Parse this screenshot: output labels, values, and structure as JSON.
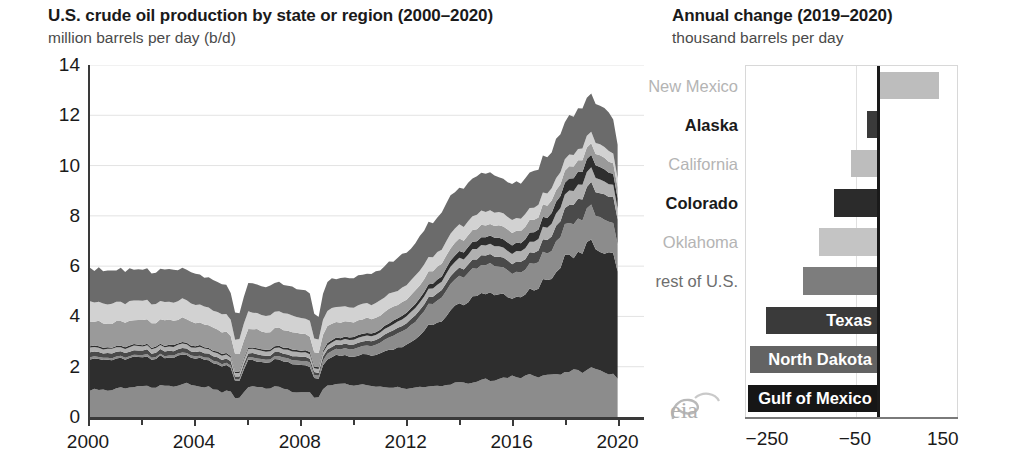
{
  "left": {
    "title": "U.S. crude oil production by state or region (2000–2020)",
    "subtitle": "million barrels per day (b/d)"
  },
  "right": {
    "title": "Annual change (2019–2020)",
    "subtitle": "thousand barrels per day"
  },
  "logo": {
    "name": "eia-logo",
    "text": "eia"
  },
  "chart_data": [
    {
      "type": "area",
      "stacked": true,
      "title": "U.S. crude oil production by state or region (2000–2020)",
      "xlabel": "",
      "ylabel": "million barrels per day (b/d)",
      "xlim": [
        2000,
        2021
      ],
      "ylim": [
        0,
        14
      ],
      "ytick_labels": [
        "0",
        "2",
        "4",
        "6",
        "8",
        "10",
        "12",
        "14"
      ],
      "ytick_values": [
        0,
        2,
        4,
        6,
        8,
        10,
        12,
        14
      ],
      "xtick_labels": [
        "2000",
        "2004",
        "2008",
        "2012",
        "2016",
        "2020"
      ],
      "xtick_values": [
        2000,
        2004,
        2008,
        2012,
        2016,
        2020
      ],
      "grid": "horizontal",
      "legend": "none",
      "x": [
        2000,
        2001,
        2002,
        2003,
        2004,
        2005,
        2006,
        2007,
        2008,
        2009,
        2010,
        2011,
        2012,
        2013,
        2014,
        2015,
        2016,
        2017,
        2018,
        2019,
        2020
      ],
      "series": [
        {
          "name": "Gulf of Mexico",
          "color": "#8c8c8c",
          "values": [
            1.05,
            1.1,
            1.2,
            1.25,
            1.3,
            1.0,
            1.15,
            1.2,
            0.95,
            1.3,
            1.3,
            1.2,
            1.15,
            1.2,
            1.35,
            1.5,
            1.6,
            1.65,
            1.75,
            1.9,
            1.65
          ]
        },
        {
          "name": "Texas",
          "color": "#2e2e2e",
          "values": [
            1.25,
            1.2,
            1.15,
            1.15,
            1.1,
            1.05,
            1.05,
            1.05,
            1.1,
            1.1,
            1.15,
            1.3,
            1.75,
            2.45,
            3.15,
            3.45,
            3.2,
            3.5,
            4.4,
            5.05,
            4.65
          ]
        },
        {
          "name": "North Dakota",
          "color": "#8c8c8c",
          "values": [
            0.09,
            0.08,
            0.08,
            0.08,
            0.09,
            0.1,
            0.11,
            0.12,
            0.17,
            0.22,
            0.3,
            0.42,
            0.65,
            0.85,
            1.1,
            1.15,
            1.0,
            1.05,
            1.25,
            1.42,
            1.15
          ]
        },
        {
          "name": "New Mexico",
          "color": "#4a4a4a",
          "values": [
            0.19,
            0.18,
            0.18,
            0.18,
            0.17,
            0.17,
            0.16,
            0.16,
            0.16,
            0.17,
            0.18,
            0.2,
            0.23,
            0.28,
            0.33,
            0.38,
            0.4,
            0.47,
            0.67,
            0.93,
            1.07
          ]
        },
        {
          "name": "Oklahoma",
          "color": "#b0b0b0",
          "values": [
            0.18,
            0.17,
            0.17,
            0.17,
            0.17,
            0.17,
            0.17,
            0.17,
            0.18,
            0.18,
            0.19,
            0.21,
            0.27,
            0.33,
            0.38,
            0.42,
            0.4,
            0.46,
            0.54,
            0.58,
            0.46
          ]
        },
        {
          "name": "Colorado",
          "color": "#2e2e2e",
          "values": [
            0.06,
            0.06,
            0.06,
            0.06,
            0.06,
            0.06,
            0.06,
            0.07,
            0.08,
            0.09,
            0.1,
            0.12,
            0.15,
            0.19,
            0.27,
            0.33,
            0.33,
            0.37,
            0.48,
            0.52,
            0.42
          ]
        },
        {
          "name": "Alaska",
          "color": "#9a9a9a",
          "values": [
            0.97,
            0.96,
            0.98,
            0.97,
            0.91,
            0.86,
            0.74,
            0.72,
            0.68,
            0.65,
            0.6,
            0.56,
            0.53,
            0.51,
            0.48,
            0.48,
            0.49,
            0.48,
            0.47,
            0.46,
            0.44
          ]
        },
        {
          "name": "California",
          "color": "#d2d2d2",
          "values": [
            0.79,
            0.77,
            0.76,
            0.74,
            0.73,
            0.7,
            0.69,
            0.66,
            0.64,
            0.62,
            0.6,
            0.59,
            0.58,
            0.57,
            0.56,
            0.54,
            0.51,
            0.48,
            0.47,
            0.45,
            0.39
          ]
        },
        {
          "name": "rest of U.S.",
          "color": "#6b6b6b",
          "values": [
            1.33,
            1.3,
            1.28,
            1.26,
            1.23,
            1.16,
            1.16,
            1.14,
            1.1,
            1.14,
            1.17,
            1.22,
            1.3,
            1.4,
            1.52,
            1.53,
            1.4,
            1.42,
            1.53,
            1.6,
            1.42
          ]
        }
      ]
    },
    {
      "type": "bar",
      "orientation": "horizontal",
      "title": "Annual change (2019–2020)",
      "xlabel": "thousand barrels per day",
      "ylabel": "",
      "xlim": [
        -300,
        180
      ],
      "xtick_labels": [
        "−250",
        "−50",
        "150"
      ],
      "xtick_values": [
        -250,
        -50,
        150
      ],
      "grid": "vertical",
      "categories": [
        "New Mexico",
        "Alaska",
        "California",
        "Colorado",
        "Oklahoma",
        "rest of U.S.",
        "Texas",
        "North Dakota",
        "Gulf of Mexico"
      ],
      "values": [
        140,
        -25,
        -62,
        -100,
        -135,
        -170,
        -255,
        -290,
        -295
      ],
      "bars": [
        {
          "label": "New Mexico",
          "value": 140,
          "color": "#bdbdbd",
          "label_style": "light",
          "label_inside": false
        },
        {
          "label": "Alaska",
          "value": -25,
          "color": "#3a3a3a",
          "label_style": "bold",
          "label_inside": false
        },
        {
          "label": "California",
          "value": -62,
          "color": "#bdbdbd",
          "label_style": "light",
          "label_inside": false
        },
        {
          "label": "Colorado",
          "value": -100,
          "color": "#2b2b2b",
          "label_style": "bold",
          "label_inside": false
        },
        {
          "label": "Oklahoma",
          "value": -135,
          "color": "#c4c4c4",
          "label_style": "light",
          "label_inside": false
        },
        {
          "label": "rest of U.S.",
          "value": -170,
          "color": "#7d7d7d",
          "label_style": "mid",
          "label_inside": false
        },
        {
          "label": "Texas",
          "value": -255,
          "color": "#3a3a3a",
          "label_style": "bold",
          "label_inside": true
        },
        {
          "label": "North Dakota",
          "value": -290,
          "color": "#636363",
          "label_style": "bold",
          "label_inside": true
        },
        {
          "label": "Gulf of Mexico",
          "value": -295,
          "color": "#161616",
          "label_style": "bold",
          "label_inside": true
        }
      ]
    }
  ]
}
